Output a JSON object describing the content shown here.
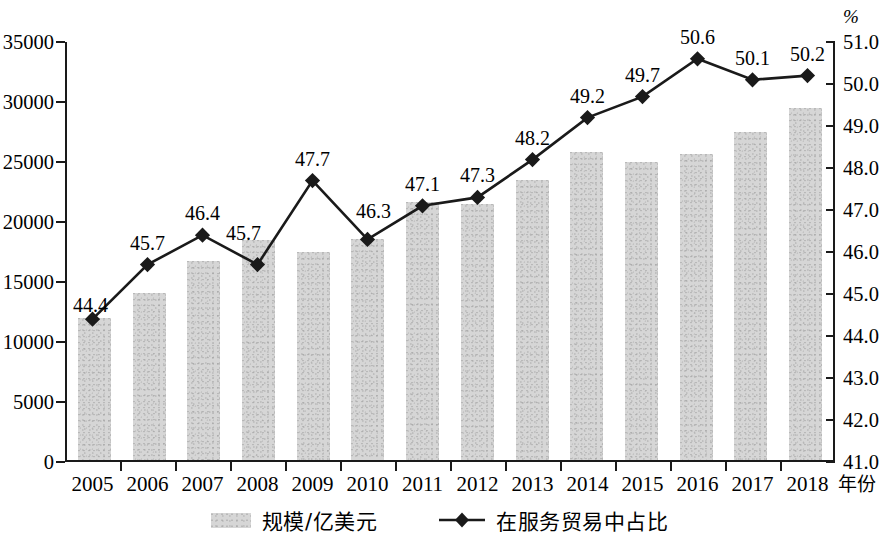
{
  "chart_data": {
    "type": "bar",
    "title": "",
    "xlabel": "年份",
    "categories": [
      "2005",
      "2006",
      "2007",
      "2008",
      "2009",
      "2010",
      "2011",
      "2012",
      "2013",
      "2014",
      "2015",
      "2016",
      "2017",
      "2018"
    ],
    "series": [
      {
        "name": "规模/亿美元",
        "type": "bar",
        "axis": "left",
        "color": "#d6d6d6",
        "values": [
          11800,
          13900,
          16600,
          18300,
          17300,
          18400,
          21500,
          21300,
          23300,
          25700,
          24800,
          25500,
          27300,
          29300
        ]
      },
      {
        "name": "在服务贸易中占比",
        "type": "line",
        "axis": "right",
        "color": "#1a1a1a",
        "marker": "diamond",
        "values": [
          44.4,
          45.7,
          46.4,
          45.7,
          47.7,
          46.3,
          47.1,
          47.3,
          48.2,
          49.2,
          49.7,
          50.6,
          50.1,
          50.2
        ],
        "labels": [
          "44.4",
          "45.7",
          "46.4",
          "45.7",
          "47.7",
          "46.3",
          "47.1",
          "47.3",
          "48.2",
          "49.2",
          "49.7",
          "50.6",
          "50.1",
          "50.2"
        ]
      }
    ],
    "left_axis": {
      "label": "",
      "ylim": [
        0,
        35000
      ],
      "ticks": [
        0,
        5000,
        10000,
        15000,
        20000,
        25000,
        30000,
        35000
      ],
      "tick_labels": [
        "0",
        "5000",
        "10000",
        "15000",
        "20000",
        "25000",
        "30000",
        "35000"
      ]
    },
    "right_axis": {
      "unit": "%",
      "ylim": [
        41.0,
        51.0
      ],
      "ticks": [
        41.0,
        42.0,
        43.0,
        44.0,
        45.0,
        46.0,
        47.0,
        48.0,
        49.0,
        50.0,
        51.0
      ],
      "tick_labels": [
        "41.0",
        "42.0",
        "43.0",
        "44.0",
        "45.0",
        "46.0",
        "47.0",
        "48.0",
        "49.0",
        "50.0",
        "51.0"
      ]
    },
    "grid": false,
    "legend": {
      "position": "bottom",
      "entries": [
        {
          "label": "规模/亿美元",
          "marker": "bar-swatch"
        },
        {
          "label": "在服务贸易中占比",
          "marker": "line-diamond"
        }
      ]
    }
  }
}
